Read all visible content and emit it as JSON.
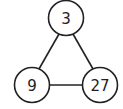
{
  "diagram": {
    "type": "graph",
    "nodes": [
      {
        "id": "top",
        "label": "3",
        "cx": 66,
        "cy": 18,
        "r": 17.5
      },
      {
        "id": "bottom-left",
        "label": "9",
        "cx": 32,
        "cy": 85,
        "r": 17.5
      },
      {
        "id": "bottom-right",
        "label": "27",
        "cx": 100,
        "cy": 85,
        "r": 17.5
      }
    ],
    "edges": [
      {
        "from": "top",
        "to": "bottom-left"
      },
      {
        "from": "top",
        "to": "bottom-right"
      },
      {
        "from": "bottom-left",
        "to": "bottom-right"
      }
    ],
    "colors": {
      "stroke": "#222222",
      "background": "#ffffff"
    }
  }
}
